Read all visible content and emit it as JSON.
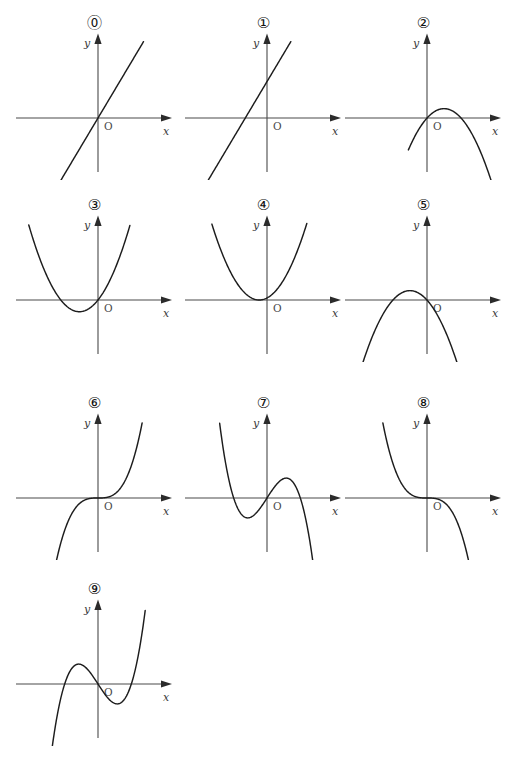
{
  "figure": {
    "title": "",
    "background_color": "#ffffff",
    "curve_color": "#1d1d1d",
    "axis_color": "#4a4a4a",
    "columns": 3,
    "rows": 4,
    "count": 10
  },
  "axis_labels": {
    "x": "x",
    "y": "y",
    "origin": "O"
  },
  "chart_data": {
    "type": "line",
    "title": "",
    "xlabel": "x",
    "ylabel": "y",
    "grid": false,
    "legend": "none",
    "panels": [
      {
        "id": 0,
        "label": "⓪",
        "label_text": "0",
        "kind": "linear",
        "description": "increasing straight line through the origin",
        "equation": "y = 2x",
        "xlim": [
          -2.2,
          2.2
        ],
        "ylim": [
          -2.2,
          2.2
        ],
        "x_intercepts": [
          0
        ],
        "y_intercept": 0,
        "slope": 2,
        "points": [
          [
            -1.4,
            -2.8
          ],
          [
            0,
            0
          ],
          [
            1.3,
            2.6
          ]
        ]
      },
      {
        "id": 1,
        "label": "①",
        "label_text": "1",
        "kind": "linear",
        "description": "increasing straight line with positive y-intercept, crossing x-axis left of the origin",
        "equation": "y = 2x + 1.4",
        "xlim": [
          -2.2,
          2.2
        ],
        "ylim": [
          -2.2,
          2.2
        ],
        "x_intercepts": [
          -0.7
        ],
        "y_intercept": 1.4,
        "slope": 2,
        "points": [
          [
            -1.9,
            -2.4
          ],
          [
            -0.7,
            0
          ],
          [
            0,
            1.4
          ],
          [
            0.85,
            3.1
          ]
        ]
      },
      {
        "id": 2,
        "label": "②",
        "label_text": "2",
        "kind": "quadratic",
        "description": "downward parabola through the origin, vertex just right of the y-axis and above the x-axis",
        "equation": "y = -(x - 0.55)^2 + 0.3",
        "xlim": [
          -2.2,
          2.2
        ],
        "ylim": [
          -2.6,
          2.2
        ],
        "vertex": [
          0.55,
          0.3
        ],
        "opens": "down",
        "x_intercepts": [
          0,
          1.1
        ],
        "y_intercept": 0,
        "points": [
          [
            -0.35,
            -0.5
          ],
          [
            0,
            0
          ],
          [
            0.55,
            0.3
          ],
          [
            1.1,
            0
          ],
          [
            1.9,
            -1.5
          ]
        ]
      },
      {
        "id": 3,
        "label": "③",
        "label_text": "3",
        "kind": "quadratic",
        "description": "upward parabola through the origin, vertex left of the y-axis and below the x-axis",
        "equation": "y = (x + 0.6)^2 - 0.36",
        "xlim": [
          -2.4,
          2.2
        ],
        "ylim": [
          -1.2,
          3.0
        ],
        "vertex": [
          -0.6,
          -0.36
        ],
        "opens": "up",
        "x_intercepts": [
          -1.2,
          0
        ],
        "y_intercept": 0,
        "points": [
          [
            -2.1,
            1.9
          ],
          [
            -1.2,
            0
          ],
          [
            -0.6,
            -0.36
          ],
          [
            0,
            0
          ],
          [
            1.0,
            2.2
          ]
        ]
      },
      {
        "id": 4,
        "label": "④",
        "label_text": "4",
        "kind": "quadratic",
        "description": "upward parabola tangent to the x-axis with vertex just left of the origin",
        "equation": "y = (x + 0.25)^2",
        "xlim": [
          -2.4,
          2.2
        ],
        "ylim": [
          -1.2,
          3.0
        ],
        "vertex": [
          -0.25,
          0
        ],
        "opens": "up",
        "x_intercepts": [
          -0.25
        ],
        "y_intercept": 0.06,
        "points": [
          [
            -1.9,
            2.7
          ],
          [
            -0.25,
            0
          ],
          [
            0,
            0.06
          ],
          [
            1.4,
            2.7
          ]
        ]
      },
      {
        "id": 5,
        "label": "⑤",
        "label_text": "5",
        "kind": "quadratic",
        "description": "downward parabola through the origin, vertex left of the y-axis and above the x-axis",
        "equation": "y = -(x + 0.55)^2 + 0.3",
        "xlim": [
          -2.2,
          2.2
        ],
        "ylim": [
          -2.6,
          2.2
        ],
        "vertex": [
          -0.55,
          0.3
        ],
        "opens": "down",
        "x_intercepts": [
          -1.1,
          0
        ],
        "y_intercept": 0,
        "points": [
          [
            -1.75,
            -1.2
          ],
          [
            -1.1,
            0
          ],
          [
            -0.55,
            0.3
          ],
          [
            0,
            0
          ],
          [
            0.75,
            -1.4
          ]
        ]
      },
      {
        "id": 6,
        "label": "⑥",
        "label_text": "6",
        "kind": "cubic",
        "description": "increasing cubic through the origin with a flat inflection at the origin",
        "equation": "y = x^3",
        "xlim": [
          -2.2,
          2.2
        ],
        "ylim": [
          -2.6,
          2.6
        ],
        "inflection": [
          0,
          0
        ],
        "leading_sign": "positive",
        "x_intercepts": [
          0
        ],
        "y_intercept": 0,
        "points": [
          [
            -1.4,
            -2.7
          ],
          [
            0,
            0
          ],
          [
            1.4,
            2.7
          ]
        ]
      },
      {
        "id": 7,
        "label": "⑦",
        "label_text": "7",
        "kind": "cubic",
        "description": "decreasing cubic through the origin with a local minimum left of the origin and a local maximum right of the origin",
        "equation": "y = -x^3 + ... (negative leading coefficient)",
        "xlim": [
          -2.2,
          2.2
        ],
        "ylim": [
          -2.8,
          2.8
        ],
        "local_min": [
          -0.62,
          -0.45
        ],
        "local_max": [
          0.62,
          0.45
        ],
        "leading_sign": "negative",
        "x_intercepts": [
          -1.25,
          0,
          1.25
        ],
        "y_intercept": 0,
        "points": [
          [
            -1.6,
            2.6
          ],
          [
            -1.25,
            0
          ],
          [
            -0.62,
            -0.45
          ],
          [
            0,
            0
          ],
          [
            0.62,
            0.45
          ],
          [
            1.25,
            0
          ],
          [
            1.65,
            -2.5
          ]
        ]
      },
      {
        "id": 8,
        "label": "⑧",
        "label_text": "8",
        "kind": "cubic",
        "description": "decreasing cubic through the origin with a flat inflection at the origin",
        "equation": "y = -x^3",
        "xlim": [
          -2.2,
          2.2
        ],
        "ylim": [
          -2.6,
          2.6
        ],
        "inflection": [
          0,
          0
        ],
        "leading_sign": "negative",
        "x_intercepts": [
          0
        ],
        "y_intercept": 0,
        "points": [
          [
            -1.4,
            2.7
          ],
          [
            0,
            0
          ],
          [
            1.4,
            -2.7
          ]
        ]
      },
      {
        "id": 9,
        "label": "⑨",
        "label_text": "9",
        "kind": "cubic",
        "description": "increasing cubic with a local maximum left of the y-axis and a local minimum right of the origin, crossing the x-axis three times",
        "equation": "y = x^3 + ... (positive leading coefficient)",
        "xlim": [
          -2.2,
          2.2
        ],
        "ylim": [
          -2.8,
          2.8
        ],
        "local_max": [
          -0.6,
          0.42
        ],
        "local_min": [
          0.62,
          -0.45
        ],
        "leading_sign": "positive",
        "x_intercepts": [
          -1.25,
          0,
          1.25
        ],
        "y_intercept": 0,
        "points": [
          [
            -1.7,
            -2.6
          ],
          [
            -1.25,
            0
          ],
          [
            -0.6,
            0.42
          ],
          [
            0,
            0
          ],
          [
            0.62,
            -0.45
          ],
          [
            1.25,
            0
          ],
          [
            1.6,
            2.6
          ]
        ]
      }
    ]
  }
}
